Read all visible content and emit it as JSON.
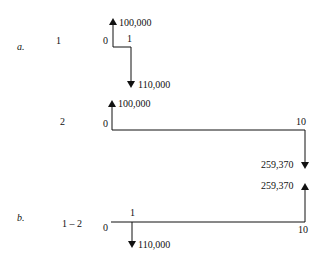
{
  "parts": {
    "a": {
      "label": "a."
    },
    "b": {
      "label": "b."
    }
  },
  "diagrams": [
    {
      "name": "1",
      "periods": {
        "start": "0",
        "end": "1"
      },
      "cash_flows": [
        {
          "period": 0,
          "amount": "100,000",
          "direction": "inflow"
        },
        {
          "period": 1,
          "amount": "110,000",
          "direction": "outflow"
        }
      ]
    },
    {
      "name": "2",
      "periods": {
        "start": "0",
        "end": "10"
      },
      "cash_flows": [
        {
          "period": 0,
          "amount": "100,000",
          "direction": "inflow"
        },
        {
          "period": 10,
          "amount": "259,370",
          "direction": "outflow"
        }
      ]
    },
    {
      "name": "1 – 2",
      "periods": {
        "start": "0",
        "mid": "1",
        "end": "10"
      },
      "cash_flows": [
        {
          "period": 1,
          "amount": "110,000",
          "direction": "outflow"
        },
        {
          "period": 10,
          "amount": "259,370",
          "direction": "inflow"
        }
      ]
    }
  ]
}
